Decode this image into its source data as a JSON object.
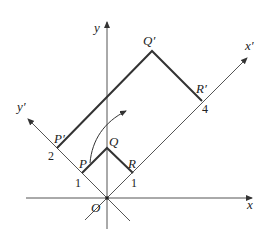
{
  "figure": {
    "type": "coordinate-rotation-diagram",
    "axes": {
      "x": "x",
      "y": "y",
      "x_prime": "x′",
      "y_prime": "y′",
      "origin": "O"
    },
    "original_square": {
      "vertices": [
        "O",
        "P",
        "Q",
        "R"
      ],
      "labels": {
        "P": "P",
        "Q": "Q",
        "R": "R"
      }
    },
    "transformed_rectangle": {
      "vertices": [
        "O",
        "P′",
        "Q′",
        "R′"
      ],
      "labels": {
        "P": "P′",
        "Q": "Q′",
        "R": "R′"
      }
    },
    "tick_labels": {
      "y_prime_1": "1",
      "y_prime_2": "2",
      "x_prime_1": "1",
      "x_prime_4": "4"
    },
    "colors": {
      "axis": "#555555",
      "shape": "#333333",
      "background": "#ffffff"
    }
  }
}
